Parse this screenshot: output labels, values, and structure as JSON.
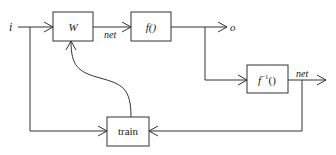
{
  "diagram": {
    "input_label": "i",
    "output_label": "o",
    "colors": {
      "stroke": "#333333",
      "text": "#1a1a1a",
      "background": "#ffffff"
    },
    "nodes": [
      {
        "id": "W",
        "label": "W"
      },
      {
        "id": "f",
        "label": "f()"
      },
      {
        "id": "finv",
        "label_base": "f",
        "label_sup": "−1",
        "label_tail": "()"
      },
      {
        "id": "train",
        "label": "train"
      }
    ],
    "edges": [
      {
        "from": "i",
        "to": "W"
      },
      {
        "from": "W",
        "to": "f",
        "label": "net"
      },
      {
        "from": "f",
        "to": "o"
      },
      {
        "from": "f",
        "to": "finv"
      },
      {
        "from": "finv",
        "to": "out",
        "label": "net"
      },
      {
        "from": "finv",
        "to": "train"
      },
      {
        "from": "i",
        "to": "train"
      },
      {
        "from": "train",
        "to": "W"
      }
    ]
  }
}
